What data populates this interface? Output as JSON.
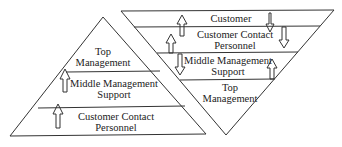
{
  "diagram": {
    "left_pyramid": {
      "title": "Traditional organization chart",
      "levels": [
        {
          "line1": "Top",
          "line2": "Management"
        },
        {
          "line1": "Middle Management",
          "line2": "Support"
        },
        {
          "line1": "Customer Contact",
          "line2": "Personnel"
        }
      ]
    },
    "right_pyramid": {
      "title": "Inverted organization chart",
      "levels": [
        {
          "line1": "Customer"
        },
        {
          "line1": "Customer Contact",
          "line2": "Personnel"
        },
        {
          "line1": "Middle Management",
          "line2": "Support"
        },
        {
          "line1": "Top",
          "line2": "Management"
        }
      ]
    },
    "colors": {
      "line": "#333333",
      "background": "#ffffff"
    }
  }
}
